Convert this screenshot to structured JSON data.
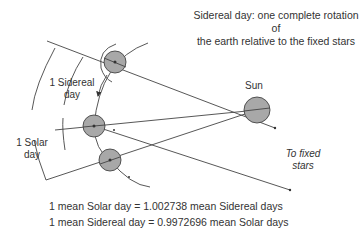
{
  "title": {
    "line1": "Sidereal day: one complete rotation of",
    "line2": "the earth relative to the fixed stars"
  },
  "labels": {
    "sun": "Sun",
    "sidereal_day_1": "1 Sidereal",
    "sidereal_day_2": "day",
    "solar_day_1": "1 Solar",
    "solar_day_2": "day",
    "fixed_stars_1": "To fixed",
    "fixed_stars_2": "stars"
  },
  "equations": {
    "solar_to_sidereal": "1 mean Solar day = 1.002738 mean Sidereal days",
    "sidereal_to_solar": "1 mean Sidereal day = 0.9972696 mean Solar days"
  },
  "colors": {
    "body_fill": "#a8a8a8",
    "stroke": "#444444"
  }
}
